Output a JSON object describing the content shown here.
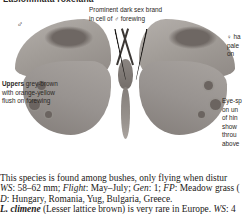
{
  "plate": {
    "title": "Lasiommata roxelana",
    "male_symbol": "♂",
    "female_symbol": "♀"
  },
  "annotations": {
    "sex_brand": {
      "line1_bold": "Prominent dark sex brand",
      "line2": "in cell of ♂ forewing"
    },
    "uppers": {
      "label": "Uppers",
      "text": " grey-brown with orange-yellow flush on forewing"
    },
    "female": {
      "line1": "♀ ha",
      "line2": "pale",
      "line3": "on"
    },
    "eyespot": {
      "line1": "Eye-sp",
      "line2": "on un",
      "line3": "of hin",
      "line4": "show",
      "line5": "throu",
      "line6": "above"
    }
  },
  "body": {
    "line1": "This species is found among bushes, only flying when distur",
    "line2_ws_label": "WS",
    "line2_ws_value": ": 58–62 mm; ",
    "line2_flight_label": "Flight",
    "line2_flight_value": ": May–July; ",
    "line2_gen_label": "Gen",
    "line2_gen_value": ": 1; ",
    "line2_fp_label": "FP",
    "line2_fp_value": ": Meadow grass (",
    "line3_d_label": "D",
    "line3_d_value": ": Hungary, Romania, Yug, Bulgaria, Greece.",
    "line4_species": "L. climene",
    "line4_common": " (Lesser lattice brown) is very rare in Europe. ",
    "line4_ws_label": "WS",
    "line4_ws_value": ": 4"
  },
  "colors": {
    "wing_base": "#9d9894",
    "sex_brand": "#6e6763",
    "body_dark": "#746e6a",
    "text": "#1d1a18",
    "page_bg": "#ffffff"
  }
}
